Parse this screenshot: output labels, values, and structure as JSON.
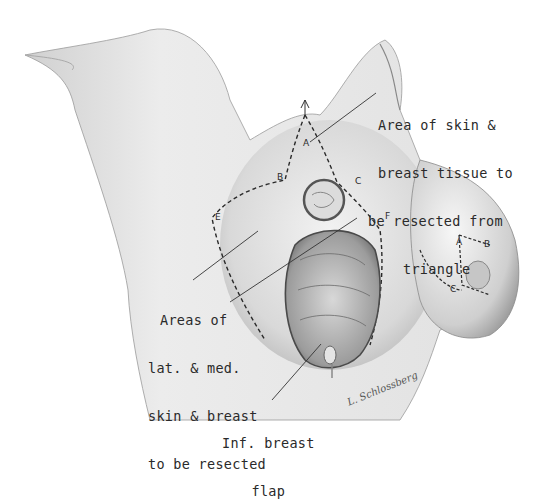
{
  "illustration": {
    "subject": "surgical breast reduction / resection diagram",
    "style": "pencil medical illustration",
    "colors": {
      "background": "#ffffff",
      "ink": "#2a2a2a",
      "skin_shade": "#bdbdbd",
      "tissue": "#8a8a8a"
    }
  },
  "labels": {
    "triangle": [
      "Area of skin &",
      "breast tissue to",
      "be resected from",
      "triangle"
    ],
    "lateral_medial": [
      "Areas of",
      "lat. & med.",
      "skin & breast",
      "to be resected"
    ],
    "inferior_flap": [
      "Inf. breast",
      "flap"
    ]
  },
  "points": {
    "left_breast": {
      "A": "A",
      "B": "B",
      "C": "C",
      "E": "E",
      "F": "F"
    },
    "right_breast": {
      "A": "A",
      "B": "B",
      "C": "C"
    }
  },
  "signature": "L. Schlossberg"
}
